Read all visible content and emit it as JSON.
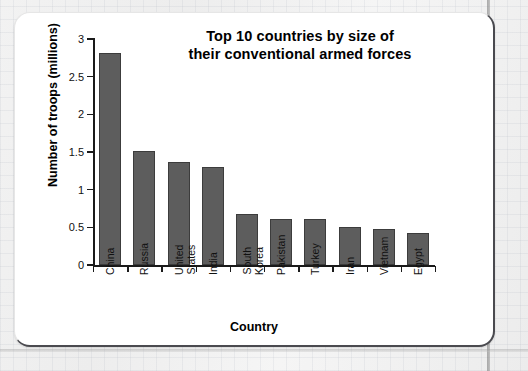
{
  "chart_data": {
    "type": "bar",
    "title": "Top 10 countries by size of their conventional armed forces",
    "title_line1": "Top 10 countries by size of",
    "title_line2": "their conventional armed forces",
    "xlabel": "Country",
    "ylabel": "Number of troops (millions)",
    "ylim": [
      0,
      3
    ],
    "grid": false,
    "legend": "none",
    "bar_color": "#5d5d5d",
    "bar_edge_color": "#3c3c3c",
    "ytick_labels": [
      "0",
      "0.5",
      "1",
      "1.5",
      "2",
      "2.5",
      "3"
    ],
    "ytick_values": [
      0,
      0.5,
      1,
      1.5,
      2,
      2.5,
      3
    ],
    "categories": [
      "China",
      "Russia",
      "United States",
      "India",
      "South Korea",
      "Pakistan",
      "Turkey",
      "Iran",
      "Vietnam",
      "Egypt"
    ],
    "category_lines": [
      [
        "China"
      ],
      [
        "Russia"
      ],
      [
        "United",
        "States"
      ],
      [
        "India"
      ],
      [
        "South",
        "Korea"
      ],
      [
        "Pakistan"
      ],
      [
        "Turkey"
      ],
      [
        "Iran"
      ],
      [
        "Vietnam"
      ],
      [
        "Egypt"
      ]
    ],
    "values": [
      2.81,
      1.51,
      1.37,
      1.3,
      0.68,
      0.61,
      0.61,
      0.51,
      0.48,
      0.43
    ],
    "units": "millions of troops"
  }
}
